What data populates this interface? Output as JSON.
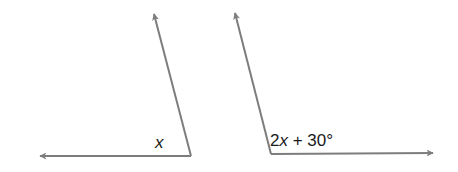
{
  "diagram": {
    "type": "two angles",
    "line_color": "#7d7d7d",
    "angles": [
      {
        "name": "left-angle",
        "vertex": [
          191,
          156
        ],
        "ray_up_tip": [
          153,
          10
        ],
        "ray_side_tip": [
          36,
          156
        ],
        "label": {
          "prefix": "",
          "variable": "x",
          "suffix": ""
        }
      },
      {
        "name": "right-angle",
        "vertex": [
          271,
          154
        ],
        "ray_up_tip": [
          234,
          9
        ],
        "ray_side_tip": [
          437,
          153
        ],
        "label": {
          "prefix": "2",
          "variable": "x",
          "suffix": " + 30°"
        }
      }
    ]
  }
}
